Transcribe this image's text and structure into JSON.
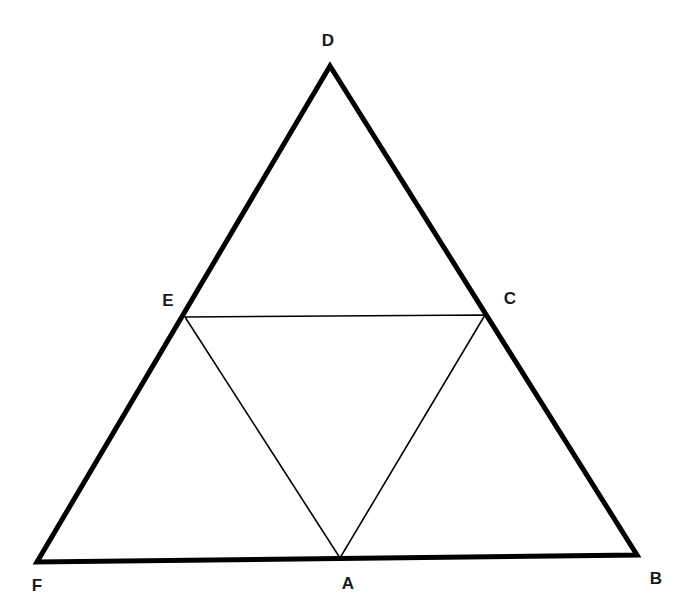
{
  "diagram": {
    "type": "geometry",
    "points": {
      "D": {
        "x": 330,
        "y": 66,
        "label": "D",
        "lx": 328,
        "ly": 46
      },
      "E": {
        "x": 185,
        "y": 317,
        "label": "E",
        "lx": 168,
        "ly": 306
      },
      "C": {
        "x": 485,
        "y": 315,
        "label": "C",
        "lx": 510,
        "ly": 304
      },
      "F": {
        "x": 37,
        "y": 562,
        "label": "F",
        "lx": 37,
        "ly": 591
      },
      "A": {
        "x": 340,
        "y": 558,
        "label": "A",
        "lx": 348,
        "ly": 589
      },
      "B": {
        "x": 637,
        "y": 555,
        "label": "B",
        "lx": 656,
        "ly": 584
      }
    },
    "outer_triangle": [
      "D",
      "F",
      "B"
    ],
    "inner_triangle": [
      "E",
      "C",
      "A"
    ],
    "line_color": "#000000",
    "outer_stroke_width": 5,
    "inner_stroke_width": 1.6
  }
}
